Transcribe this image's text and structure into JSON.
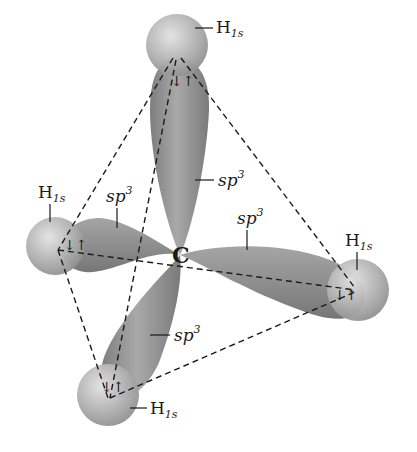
{
  "diagram": {
    "center_atom": {
      "label": "C",
      "x": 180,
      "y": 255
    },
    "colors": {
      "lobe": "#8a8a8a",
      "lobe_light": "#c4c4c4",
      "sphere": "#a8a8a8",
      "sphere_light": "#dedede",
      "dash": "#1a1a1a",
      "text": "#1a1a1a"
    },
    "hydrogens": [
      {
        "id": "top",
        "label_main": "H",
        "label_sub": "1s",
        "x": 177,
        "y": 45,
        "r": 31,
        "label_x": 216,
        "label_y": 33
      },
      {
        "id": "left",
        "label_main": "H",
        "label_sub": "1s",
        "x": 55,
        "y": 246,
        "r": 29,
        "label_x": 40,
        "label_y": 195
      },
      {
        "id": "right",
        "label_main": "H",
        "label_sub": "1s",
        "x": 358,
        "y": 290,
        "r": 31,
        "label_x": 343,
        "label_y": 242
      },
      {
        "id": "bottom",
        "label_main": "H",
        "label_sub": "1s",
        "x": 108,
        "y": 395,
        "r": 31,
        "label_x": 150,
        "label_y": 414
      }
    ],
    "orbitals": [
      {
        "id": "top-lobe",
        "label_main": "sp",
        "label_sup": "3",
        "label_x": 222,
        "label_y": 190
      },
      {
        "id": "left-lobe",
        "label_main": "sp",
        "label_sup": "3",
        "label_x": 108,
        "label_y": 198
      },
      {
        "id": "right-lobe",
        "label_main": "sp",
        "label_sup": "3",
        "label_x": 228,
        "label_y": 222
      },
      {
        "id": "bottom-lobe",
        "label_main": "sp",
        "label_sup": "3",
        "label_x": 178,
        "label_y": 340
      }
    ],
    "electron_pair_symbol": "↓↑"
  }
}
